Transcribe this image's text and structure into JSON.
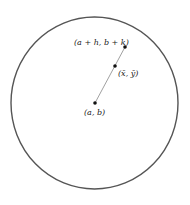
{
  "diagram": {
    "circle": {
      "cx": 94.5,
      "cy": 103,
      "rx": 83.5,
      "ry": 86,
      "stroke": "#555555"
    },
    "points": [
      {
        "id": "outer",
        "label": "(a + h, b + k)",
        "x": 125,
        "y": 47
      },
      {
        "id": "mean",
        "label": "(x̄, ȳ)",
        "x": 115,
        "y": 66
      },
      {
        "id": "center",
        "label": "(a, b)",
        "x": 95,
        "y": 103
      }
    ],
    "segment": {
      "from": "center",
      "to": "outer",
      "stroke": "#888888"
    }
  }
}
